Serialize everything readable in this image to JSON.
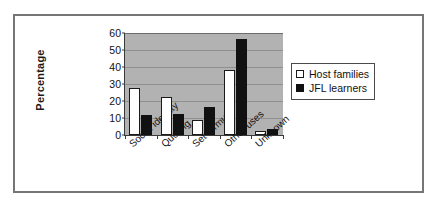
{
  "chart_data": {
    "type": "bar",
    "title": "",
    "subtitle": "",
    "xlabel": "",
    "ylabel": "Percentage",
    "ylim": [
      0,
      60
    ],
    "ytick_step": 10,
    "yticks": [
      0,
      10,
      20,
      30,
      40,
      50,
      60
    ],
    "grid": true,
    "grid_axis": "y",
    "legend_position": "right",
    "plot_background": "#b2b2b2",
    "categories": [
      "Social identity",
      "Quoting",
      "Set formula",
      "Other uses",
      "Unknown"
    ],
    "series": [
      {
        "name": "Host families",
        "color": "#ffffff",
        "edge_color": "#1a1a1a",
        "values": [
          27.5,
          22.5,
          9.0,
          38.5,
          2.5
        ]
      },
      {
        "name": "JFL learners",
        "color": "#111111",
        "edge_color": "#111111",
        "values": [
          11.5,
          12.5,
          16.5,
          56.5,
          3.5
        ]
      }
    ]
  },
  "legend": {
    "items": [
      {
        "label": "Host families",
        "marker": "white-square-icon"
      },
      {
        "label": "JFL learners",
        "marker": "black-square-icon"
      }
    ]
  },
  "colors": {
    "frame_border": "#767676",
    "plot_background": "#b2b2b2",
    "gridline": "#8f8f8f",
    "axis": "#3a3a3a",
    "text": "#111111"
  }
}
